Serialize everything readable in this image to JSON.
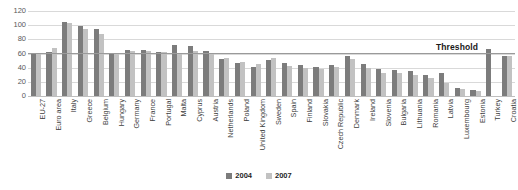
{
  "chart_data": {
    "type": "bar",
    "title": "",
    "subtitle": "",
    "xlabel": "",
    "ylabel": "",
    "ylim": [
      0,
      120
    ],
    "yticks": [
      0,
      20,
      40,
      60,
      80,
      100,
      120
    ],
    "grid": true,
    "legend_position": "bottom",
    "categories": [
      "EU-27",
      "Euro area",
      "Italy",
      "Greece",
      "Belgium",
      "Hungary",
      "Germany",
      "France",
      "Portugal",
      "Malta",
      "Cyprus",
      "Austria",
      "Netherlands",
      "Poland",
      "United Kingdom",
      "Sweden",
      "Spain",
      "Finland",
      "Slovakia",
      "Czech Republic",
      "Denmark",
      "Ireland",
      "Slovenia",
      "Bulgaria",
      "Lithuania",
      "Romania",
      "Latvia",
      "Luxembourg",
      "Estonia",
      "Turkey",
      "Croatia"
    ],
    "series": [
      {
        "name": "2004",
        "color": "#7c7c7c",
        "values": [
          61,
          62,
          104,
          99,
          94,
          60,
          65,
          65,
          62,
          72,
          71,
          64,
          52,
          46,
          41,
          51,
          46,
          44,
          41,
          44,
          56,
          45,
          38,
          37,
          35,
          29,
          32,
          12,
          9,
          66,
          56
        ]
      },
      {
        "name": "2007",
        "color": "#c2c2c2",
        "values": [
          60,
          68,
          103,
          95,
          87,
          60,
          63,
          64,
          62,
          61,
          63,
          60,
          54,
          48,
          45,
          54,
          43,
          39,
          38,
          41,
          52,
          40,
          33,
          32,
          30,
          25,
          19,
          10,
          7,
          0,
          56
        ]
      }
    ],
    "annotations": [
      {
        "name": "threshold",
        "label": "Threshold",
        "value": 60
      }
    ]
  },
  "legend": {
    "items": [
      {
        "label": "2004",
        "color": "#7c7c7c"
      },
      {
        "label": "2007",
        "color": "#c2c2c2"
      }
    ]
  }
}
